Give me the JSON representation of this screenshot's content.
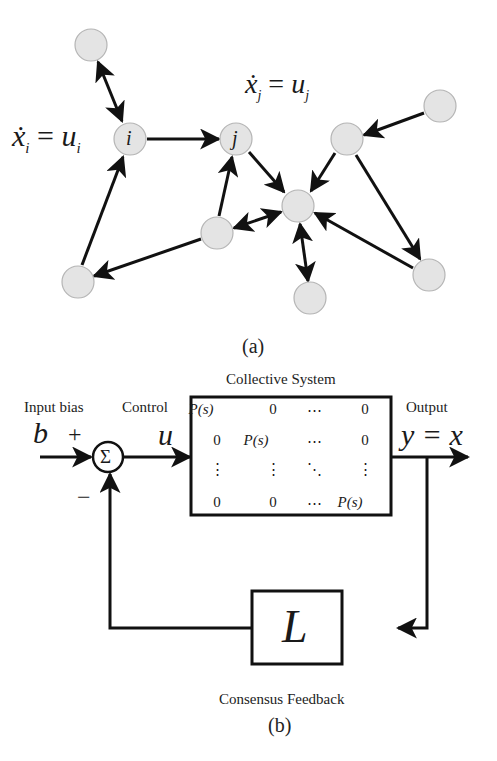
{
  "graph": {
    "caption": "(a)",
    "label_i": "ẋᵢ = uᵢ",
    "label_i_parts": {
      "lhs": "ẋ",
      "sub": "i",
      "eq": "=",
      "rhs": "u",
      "rhs_sub": "i"
    },
    "label_j_parts": {
      "lhs": "ẋ",
      "sub": "j",
      "eq": "=",
      "rhs": "u",
      "rhs_sub": "j"
    },
    "node_i_label": "i",
    "node_j_label": "j",
    "node_fill": "#e4e4e4",
    "node_stroke": "#b8b8b8",
    "nodes": [
      {
        "id": "n_topleft",
        "x": 91,
        "y": 45
      },
      {
        "id": "i",
        "x": 130,
        "y": 139
      },
      {
        "id": "j",
        "x": 236,
        "y": 139
      },
      {
        "id": "center",
        "x": 298,
        "y": 206
      },
      {
        "id": "n_midleft",
        "x": 217,
        "y": 233
      },
      {
        "id": "n_bottomleft",
        "x": 78,
        "y": 282
      },
      {
        "id": "n_upperright",
        "x": 347,
        "y": 139
      },
      {
        "id": "n_topright",
        "x": 440,
        "y": 106
      },
      {
        "id": "n_bottom",
        "x": 310,
        "y": 298
      },
      {
        "id": "n_bottomright",
        "x": 429,
        "y": 275
      }
    ],
    "edges": [
      {
        "from": "n_topleft",
        "to": "i",
        "bidirectional": true
      },
      {
        "from": "i",
        "to": "j",
        "bidirectional": false
      },
      {
        "from": "n_bottomleft",
        "to": "i",
        "bidirectional": false
      },
      {
        "from": "n_midleft",
        "to": "n_bottomleft",
        "bidirectional": false
      },
      {
        "from": "n_midleft",
        "to": "j",
        "bidirectional": false
      },
      {
        "from": "j",
        "to": "center",
        "bidirectional": false
      },
      {
        "from": "n_midleft",
        "to": "center",
        "bidirectional": true
      },
      {
        "from": "n_upperright",
        "to": "center",
        "bidirectional": false
      },
      {
        "from": "n_topright",
        "to": "n_upperright",
        "bidirectional": false
      },
      {
        "from": "n_upperright",
        "to": "n_bottomright",
        "bidirectional": false
      },
      {
        "from": "n_bottomright",
        "to": "center",
        "bidirectional": false
      },
      {
        "from": "center",
        "to": "n_bottom",
        "bidirectional": true
      }
    ]
  },
  "block_diagram": {
    "caption": "(b)",
    "input_label": "Input bias",
    "input_symbol": "b",
    "plus_sign": "+",
    "minus_sign": "−",
    "summer_symbol": "Σ",
    "control_label": "Control",
    "control_symbol": "u",
    "system_title": "Collective System",
    "matrix": [
      [
        "P(s)",
        "0",
        "⋯",
        "0"
      ],
      [
        "0",
        "P(s)",
        "⋯",
        "0"
      ],
      [
        "⋮",
        "⋮",
        "⋱",
        "⋮"
      ],
      [
        "0",
        "0",
        "⋯",
        "P(s)"
      ]
    ],
    "output_label": "Output",
    "output_symbol": "y = x",
    "feedback_symbol": "L",
    "feedback_label": "Consensus Feedback"
  }
}
